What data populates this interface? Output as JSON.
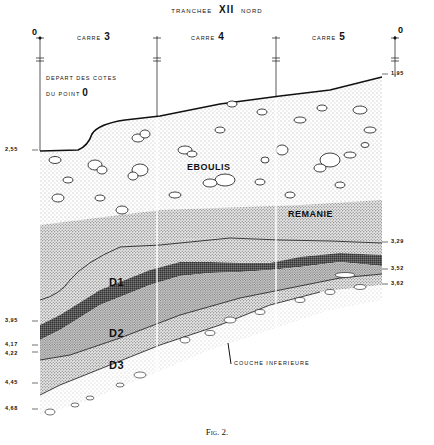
{
  "title": {
    "prefix": "TRANCHEE",
    "number": "XII",
    "suffix": "NORD"
  },
  "squares": [
    {
      "label": "CARRE",
      "number": "3"
    },
    {
      "label": "CARRE",
      "number": "4"
    },
    {
      "label": "CARRE",
      "number": "5"
    }
  ],
  "reference_points": {
    "left": "0",
    "right": "0"
  },
  "datum_note": {
    "line1": "DEPART DES COTES",
    "line2_prefix": "DU POINT",
    "line2_value": "0"
  },
  "depth_marks": {
    "left": [
      "2,55",
      "3,95",
      "4,17",
      "4,22",
      "4,45",
      "4,68"
    ],
    "right": [
      "1,95",
      "3,29",
      "3,52",
      "3,62"
    ]
  },
  "layers": {
    "eboulis": "EBOULIS",
    "remanie": "REMANIE",
    "d1": "D1",
    "d2": "D2",
    "d3": "D3"
  },
  "annotation": {
    "couche_inferieure": "COUCHE INFERIEURE"
  },
  "caption": "Fig. 2.",
  "colors": {
    "ink": "#111111",
    "background": "#ffffff",
    "stipple_light": "#c8c8c8",
    "stipple_medium": "#9a9a9a",
    "stipple_dark": "#3a3a3a"
  }
}
